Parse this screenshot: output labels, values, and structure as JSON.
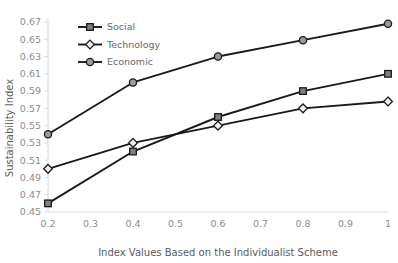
{
  "chart_data": {
    "type": "line",
    "title": "",
    "xlabel": "Index Values Based on the Individualist Scheme",
    "ylabel": "Sustainability Index",
    "x": [
      0.2,
      0.4,
      0.6,
      0.8,
      1
    ],
    "xlim": [
      0.2,
      1
    ],
    "ylim": [
      0.45,
      0.67
    ],
    "xticks": [
      0.2,
      0.3,
      0.4,
      0.5,
      0.6,
      0.7,
      0.8,
      0.9,
      1
    ],
    "xtick_labels": [
      "0.2",
      "0.3",
      "0.4",
      "0.5",
      "0.6",
      "0.7",
      "0.8",
      "0.9",
      "1"
    ],
    "yticks": [
      0.45,
      0.47,
      0.49,
      0.51,
      0.53,
      0.55,
      0.57,
      0.59,
      0.61,
      0.63,
      0.65,
      0.67
    ],
    "ytick_labels": [
      "0.45",
      "0.47",
      "0.49",
      "0.51",
      "0.53",
      "0.55",
      "0.57",
      "0.59",
      "0.61",
      "0.63",
      "0.65",
      "0.67"
    ],
    "grid": false,
    "legend_position": "upper-left-inside",
    "series": [
      {
        "name": "Social",
        "marker": "square",
        "marker_fill": "#808080",
        "line_color": "#1a1a1a",
        "values": [
          0.46,
          0.52,
          0.56,
          0.59,
          0.61
        ]
      },
      {
        "name": "Technology",
        "marker": "diamond",
        "marker_fill": "#efefef",
        "line_color": "#1a1a1a",
        "values": [
          0.5,
          0.53,
          0.55,
          0.57,
          0.578
        ]
      },
      {
        "name": "Economic",
        "marker": "circle",
        "marker_fill": "#9a9a9a",
        "line_color": "#1a1a1a",
        "values": [
          0.54,
          0.6,
          0.63,
          0.649,
          0.668
        ]
      }
    ]
  },
  "axis": {
    "y_title": "Sustainability Index",
    "x_title": "Index Values Based on the Individualist Scheme"
  },
  "legend": {
    "entries": [
      {
        "label": "Social"
      },
      {
        "label": "Technology"
      },
      {
        "label": "Economic"
      }
    ]
  },
  "colors": {
    "line": "#1a1a1a",
    "axis": "#d9d9d9",
    "tick_text": "#8c8c8c",
    "title_text": "#5a5a5a",
    "legend_text": "#666666"
  }
}
